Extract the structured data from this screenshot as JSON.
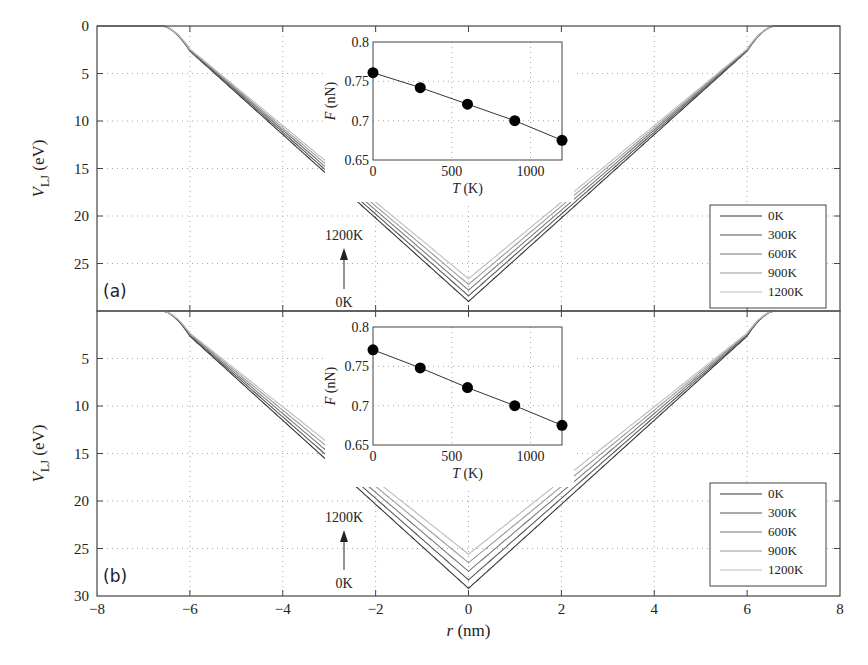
{
  "chart_data": [
    {
      "type": "line",
      "panel_label": "(a)",
      "xlabel": "r (nm)",
      "ylabel": "V_LJ (eV)",
      "xlim": [
        -8,
        8
      ],
      "ylim": [
        30,
        0
      ],
      "y_inverted": true,
      "yticks": [
        "0",
        "5",
        "10",
        "15",
        "20",
        "25"
      ],
      "xticks": [],
      "grid": true,
      "legend_position": "bottom-right",
      "series": [
        {
          "name": "0K",
          "color": "#333333",
          "min_value": 29.0,
          "flat_until": 6.6
        },
        {
          "name": "300K",
          "color": "#555555",
          "min_value": 28.4,
          "flat_until": 6.6
        },
        {
          "name": "600K",
          "color": "#777777",
          "min_value": 27.8,
          "flat_until": 6.6
        },
        {
          "name": "900K",
          "color": "#999999",
          "min_value": 27.2,
          "flat_until": 6.6
        },
        {
          "name": "1200K",
          "color": "#bbbbbb",
          "min_value": 26.6,
          "flat_until": 6.6
        }
      ],
      "annotation": {
        "top": "1200K",
        "bottom": "0K"
      },
      "inset": {
        "type": "scatter-line",
        "xlabel": "T (K)",
        "ylabel": "F (nN)",
        "xlim": [
          0,
          1200
        ],
        "ylim": [
          0.65,
          0.8
        ],
        "xticks": [
          "0",
          "500",
          "1000"
        ],
        "yticks": [
          "0.65",
          "0.7",
          "0.75",
          "0.8"
        ],
        "x": [
          0,
          300,
          600,
          900,
          1200
        ],
        "y": [
          0.761,
          0.742,
          0.721,
          0.7,
          0.675
        ]
      }
    },
    {
      "type": "line",
      "panel_label": "(b)",
      "xlabel": "r (nm)",
      "ylabel": "V_LJ (eV)",
      "xlim": [
        -8,
        8
      ],
      "ylim": [
        30,
        0
      ],
      "y_inverted": true,
      "yticks": [
        "5",
        "10",
        "15",
        "20",
        "25",
        "30"
      ],
      "xticks": [
        "−8",
        "−6",
        "−4",
        "−2",
        "0",
        "2",
        "4",
        "6",
        "8"
      ],
      "grid": true,
      "legend_position": "bottom-right",
      "series": [
        {
          "name": "0K",
          "color": "#333333",
          "min_value": 29.2,
          "flat_until": 6.6
        },
        {
          "name": "300K",
          "color": "#555555",
          "min_value": 28.3,
          "flat_until": 6.6
        },
        {
          "name": "600K",
          "color": "#777777",
          "min_value": 27.4,
          "flat_until": 6.6
        },
        {
          "name": "900K",
          "color": "#999999",
          "min_value": 26.5,
          "flat_until": 6.6
        },
        {
          "name": "1200K",
          "color": "#bbbbbb",
          "min_value": 25.6,
          "flat_until": 6.6
        }
      ],
      "annotation": {
        "top": "1200K",
        "bottom": "0K"
      },
      "inset": {
        "type": "scatter-line",
        "xlabel": "T (K)",
        "ylabel": "F (nN)",
        "xlim": [
          0,
          1200
        ],
        "ylim": [
          0.65,
          0.8
        ],
        "xticks": [
          "0",
          "500",
          "1000"
        ],
        "yticks": [
          "0.65",
          "0.7",
          "0.75",
          "0.8"
        ],
        "x": [
          0,
          300,
          600,
          900,
          1200
        ],
        "y": [
          0.771,
          0.748,
          0.723,
          0.7,
          0.675
        ]
      }
    }
  ]
}
